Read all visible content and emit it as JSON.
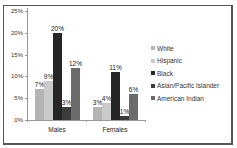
{
  "chart_data": {
    "type": "bar",
    "title": "",
    "xlabel": "",
    "ylabel": "",
    "ylim": [
      0,
      25
    ],
    "yticks": [
      "0%",
      "5%",
      "10%",
      "15%",
      "20%",
      "25%"
    ],
    "categories": [
      "Males",
      "Females"
    ],
    "series": [
      {
        "name": "White",
        "values": [
          7,
          3
        ],
        "color": "#b4b4b4"
      },
      {
        "name": "Hispanic",
        "values": [
          9,
          4
        ],
        "color": "#cacaca"
      },
      {
        "name": "Black",
        "values": [
          20,
          11
        ],
        "color": "#262626"
      },
      {
        "name": "Asian/Pacific Islander",
        "values": [
          3,
          1
        ],
        "color": "#3c3c3c"
      },
      {
        "name": "American Indian",
        "values": [
          12,
          6
        ],
        "color": "#6b6b6b"
      }
    ],
    "value_labels": {
      "Males": [
        "7%",
        "9%",
        "20%",
        "3%",
        "12%"
      ],
      "Females": [
        "3%",
        "4%",
        "11%",
        "1%",
        "6%"
      ]
    },
    "legend_position": "right",
    "grid": false
  }
}
